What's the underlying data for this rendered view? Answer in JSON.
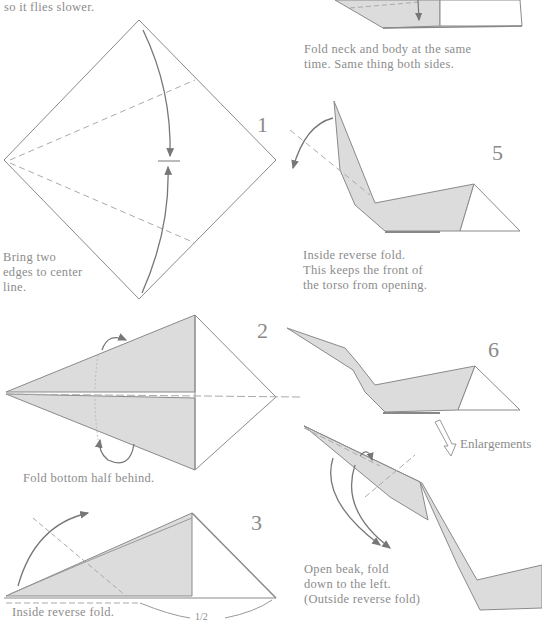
{
  "captions": {
    "intro_tail": "so it flies slower.",
    "step1": [
      "Bring two",
      "edges to center",
      "line."
    ],
    "step2": "Fold bottom half behind.",
    "step3": "Inside reverse fold.",
    "step4": [
      "Fold neck and body at the same",
      "time.  Same thing both sides."
    ],
    "step5": [
      "Inside reverse fold.",
      "This keeps the front of",
      "the torso from opening."
    ],
    "step7": [
      "Open beak, fold",
      "down to the left.",
      "(Outside reverse fold)"
    ]
  },
  "step_numbers": {
    "s1": "1",
    "s2": "2",
    "s3": "3",
    "s5": "5",
    "s6": "6"
  },
  "labels": {
    "enlargements": "Enlargements",
    "half_measure": "1/2"
  },
  "colors": {
    "paper_shade": "#dcdcdc",
    "line": "#8a8a8a",
    "text": "#8c8c8c",
    "background": "#ffffff"
  }
}
